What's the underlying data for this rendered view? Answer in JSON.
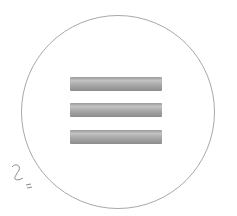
{
  "icon": {
    "name": "hamburger-menu",
    "bar_count": 3,
    "bar_color": "#a9a9a9",
    "circle_color": "#a8a8a8"
  },
  "annotation": {
    "text": "2"
  }
}
